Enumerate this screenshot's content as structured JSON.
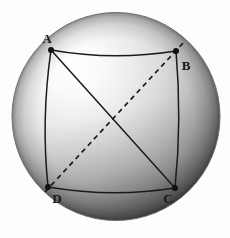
{
  "figure": {
    "type": "geometry-diagram",
    "background_color": "#fdfdfd"
  },
  "sphere": {
    "name": "sphere",
    "center_x": 116,
    "center_y": 116.5,
    "radius": 104,
    "highlight_x": 62,
    "highlight_y": 56,
    "highlight_color": "#ffffff",
    "midtone_color": "#c9c9c9",
    "shadow_color": "#6d6d6d",
    "rim_color": "#3a3a3a",
    "outline_color": "#8a8a8a"
  },
  "vertices": [
    {
      "id": "A",
      "label": "A",
      "x": 51,
      "y": 50,
      "label_x": 47,
      "label_y": 43
    },
    {
      "id": "B",
      "label": "B",
      "x": 176,
      "y": 51,
      "label_x": 186,
      "label_y": 70
    },
    {
      "id": "C",
      "label": "C",
      "x": 175,
      "y": 188,
      "label_x": 168,
      "label_y": 203
    },
    {
      "id": "D",
      "label": "D",
      "x": 48,
      "y": 187,
      "label_x": 57,
      "label_y": 203
    }
  ],
  "edges": [
    {
      "id": "AB",
      "from": "A",
      "to": "B",
      "style": "solid",
      "curve": "arc-sag-down",
      "label": "edge-a-b"
    },
    {
      "id": "BC",
      "from": "B",
      "to": "C",
      "style": "solid",
      "curve": "arc-bow-right",
      "label": "edge-b-c"
    },
    {
      "id": "CD",
      "from": "C",
      "to": "D",
      "style": "solid",
      "curve": "arc-sag-down",
      "label": "edge-c-d"
    },
    {
      "id": "DA",
      "from": "D",
      "to": "A",
      "style": "solid",
      "curve": "arc-bow-left",
      "label": "edge-d-a"
    }
  ],
  "diagonals": [
    {
      "id": "AC",
      "from": "A",
      "to": "C",
      "style": "solid",
      "label": "diagonal-a-c"
    },
    {
      "id": "DB",
      "from": "D",
      "to": "B",
      "style": "dashed",
      "label": "diagonal-d-b",
      "dash_pattern": "5,4"
    }
  ],
  "intersection": {
    "name": "diagonal-crossing",
    "x": 122,
    "y": 133
  },
  "stroke": {
    "line_color": "#1a1a1a",
    "line_width": 1.5,
    "dot_radius": 3,
    "dot_color": "#111111"
  }
}
